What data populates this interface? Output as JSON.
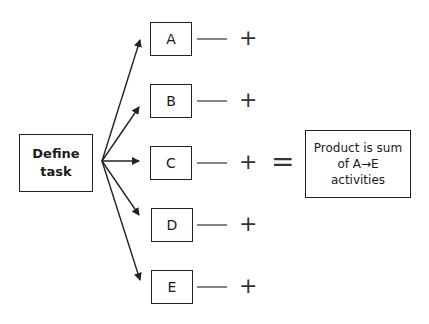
{
  "diagram": {
    "source": {
      "label_line1": "Define",
      "label_line2": "task"
    },
    "activities": [
      {
        "label": "A",
        "top": 22
      },
      {
        "label": "B",
        "top": 84
      },
      {
        "label": "C",
        "top": 146
      },
      {
        "label": "D",
        "top": 208
      },
      {
        "label": "E",
        "top": 270
      }
    ],
    "operators": {
      "plus": "+",
      "equals": "="
    },
    "result": {
      "line1": "Product is sum",
      "line2": "of A→E",
      "line3": "activities"
    },
    "stroke_color": "#222222"
  }
}
